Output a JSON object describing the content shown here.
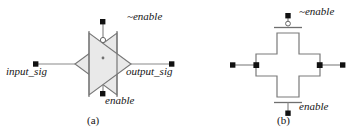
{
  "figure": {
    "colors": {
      "line": "#6b6b6b",
      "line_dark": "#4a4a4a",
      "fill": "#e8e8e8",
      "terminal": "#111111",
      "text": "#151515",
      "background": "#ffffff"
    },
    "subfigures": [
      {
        "id": "a",
        "caption": "(a)",
        "kind": "schematic-symbol",
        "shape": "bowtie",
        "terminals": [
          {
            "name": "enable-bar-terminal",
            "label": "~enable",
            "position": "top",
            "bubble": true
          },
          {
            "name": "input-terminal",
            "label": "input_sig",
            "position": "left",
            "bubble": false
          },
          {
            "name": "output-terminal",
            "label": "output_sig",
            "position": "right",
            "bubble": false
          },
          {
            "name": "enable-terminal",
            "label": "enable",
            "position": "bottom",
            "bubble": false
          }
        ]
      },
      {
        "id": "b",
        "caption": "(b)",
        "kind": "layout-view",
        "shape": "cross",
        "terminals": [
          {
            "name": "enable-bar-terminal",
            "label": "~enable",
            "position": "top",
            "bubble": true
          },
          {
            "name": "input-terminal",
            "label": "",
            "position": "left",
            "bubble": false
          },
          {
            "name": "output-terminal",
            "label": "",
            "position": "right",
            "bubble": false
          },
          {
            "name": "enable-terminal",
            "label": "enable",
            "position": "bottom",
            "bubble": false
          }
        ]
      }
    ]
  },
  "labels": {
    "a": {
      "enable_bar": "~enable",
      "input_sig": "input_sig",
      "output_sig": "output_sig",
      "enable": "enable",
      "caption": "(a)"
    },
    "b": {
      "enable_bar": "~enable",
      "enable": "enable",
      "caption": "(b)"
    }
  }
}
